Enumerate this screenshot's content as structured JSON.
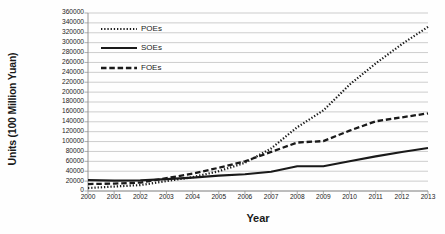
{
  "chart_data": {
    "type": "line",
    "title": "",
    "xlabel": "Year",
    "ylabel": "Units (100 Million Yuan)",
    "x": [
      2000,
      2001,
      2002,
      2003,
      2004,
      2005,
      2006,
      2007,
      2008,
      2009,
      2010,
      2011,
      2012,
      2013
    ],
    "categories": [
      "2000",
      "2001",
      "2002",
      "2003",
      "2004",
      "2005",
      "2006",
      "2007",
      "2008",
      "2009",
      "2010",
      "2011",
      "2012",
      "2013"
    ],
    "xlim": [
      2000,
      2013
    ],
    "ylim": [
      0,
      360000
    ],
    "ytick_step": 20000,
    "yticks": [
      0,
      20000,
      40000,
      60000,
      80000,
      100000,
      120000,
      140000,
      160000,
      180000,
      200000,
      220000,
      240000,
      260000,
      280000,
      300000,
      320000,
      340000,
      360000
    ],
    "ytick_labels": [
      "0",
      "20000",
      "40000",
      "60000",
      "80000",
      "100000",
      "120000",
      "140000",
      "160000",
      "180000",
      "200000",
      "220000",
      "240000",
      "260000",
      "280000",
      "300000",
      "320000",
      "340000",
      "360000"
    ],
    "grid": true,
    "grid_axis": "y",
    "legend_position": "upper-left-inside",
    "series": [
      {
        "name": "POEs",
        "style": "dotted",
        "color": "#1a1a1a",
        "values": [
          6000,
          9000,
          12000,
          20000,
          28000,
          40000,
          57000,
          86000,
          129000,
          163000,
          215000,
          258000,
          297000,
          332000
        ]
      },
      {
        "name": "SOEs",
        "style": "solid",
        "color": "#1a1a1a",
        "values": [
          22000,
          21000,
          21500,
          24000,
          27000,
          31000,
          34000,
          39000,
          50000,
          50000,
          60000,
          70000,
          79000,
          87000
        ]
      },
      {
        "name": "FOEs",
        "style": "dashed",
        "color": "#1a1a1a",
        "values": [
          14000,
          15000,
          17000,
          26000,
          35000,
          47000,
          60000,
          79000,
          98000,
          101000,
          122000,
          141000,
          149000,
          157000
        ]
      }
    ]
  },
  "legend": {
    "items": [
      {
        "label": "POEs",
        "style": "dotted"
      },
      {
        "label": "SOEs",
        "style": "solid"
      },
      {
        "label": "FOEs",
        "style": "dashed"
      }
    ]
  },
  "colors": {
    "ink": "#1a1a1a",
    "grid": "#b8b8b8",
    "axis": "#8a8a8a",
    "background": "#ffffff"
  }
}
